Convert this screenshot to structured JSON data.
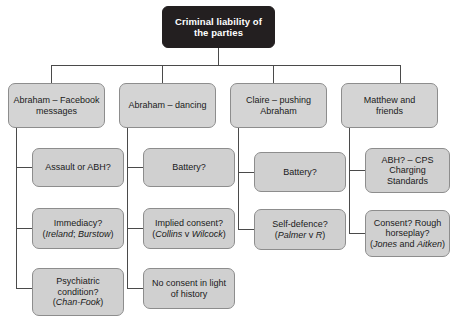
{
  "diagram": {
    "title": "Criminal liability of the parties",
    "type": "tree-flowchart",
    "colors": {
      "root_fill": "#231f20",
      "root_text": "#ffffff",
      "node_fill": "#d4d4d4",
      "node_border": "#8d8d8d",
      "node_text": "#1a1a1a",
      "connector": "#4a4a4a",
      "background": "#ffffff"
    },
    "root": {
      "line1": "Criminal liability of",
      "line2": "the parties"
    },
    "branches": [
      {
        "id": "abraham-facebook",
        "line1": "Abraham – Facebook",
        "line2": "messages",
        "children": [
          {
            "id": "assault-or-abh",
            "line1": "Assault or ABH?",
            "line2": "",
            "citation": ""
          },
          {
            "id": "immediacy",
            "line1": "Immediacy?",
            "line2": "",
            "citation": "(Ireland; Burstow)",
            "citation_parts": {
              "open": "(",
              "case1": "Ireland",
              "sep": "; ",
              "case2": "Burstow",
              "close": ")"
            }
          },
          {
            "id": "psychiatric-condition",
            "line1": "Psychiatric",
            "line2": "condition?",
            "citation": "(Chan-Fook)",
            "citation_parts": {
              "open": "(",
              "case1": "Chan-Fook",
              "sep": "",
              "case2": "",
              "close": ")"
            }
          }
        ]
      },
      {
        "id": "abraham-dancing",
        "line1": "Abraham – dancing",
        "line2": "",
        "children": [
          {
            "id": "battery-dancing",
            "line1": "Battery?",
            "line2": "",
            "citation": ""
          },
          {
            "id": "implied-consent",
            "line1": "Implied consent?",
            "line2": "",
            "citation": "(Collins v Wilcock)",
            "citation_parts": {
              "open": "(",
              "case1": "Collins",
              "sep": " v ",
              "case2": "Wilcock",
              "close": ")"
            }
          },
          {
            "id": "no-consent-history",
            "line1": "No consent in light",
            "line2": "of history",
            "citation": ""
          }
        ]
      },
      {
        "id": "claire-pushing",
        "line1": "Claire – pushing",
        "line2": "Abraham",
        "children": [
          {
            "id": "battery-claire",
            "line1": "Battery?",
            "line2": "",
            "citation": ""
          },
          {
            "id": "self-defence",
            "line1": "Self-defence?",
            "line2": "",
            "citation": "(Palmer v R)",
            "citation_parts": {
              "open": "(",
              "case1": "Palmer",
              "sep": " v ",
              "case2": "R",
              "close": ")"
            }
          }
        ]
      },
      {
        "id": "matthew-and-friends",
        "line1": "Matthew and",
        "line2": "friends",
        "children": [
          {
            "id": "abh-cps-charging-standards",
            "line1": "ABH? – CPS",
            "line2": "Charging",
            "line3": "Standards",
            "citation": ""
          },
          {
            "id": "consent-rough-horseplay",
            "line1": "Consent? Rough",
            "line2": "horseplay?",
            "citation": "(Jones and Aitken)",
            "citation_parts": {
              "open": "(",
              "case1": "Jones",
              "sep": " and ",
              "case2": "Aitken",
              "close": ")"
            }
          }
        ]
      }
    ]
  }
}
